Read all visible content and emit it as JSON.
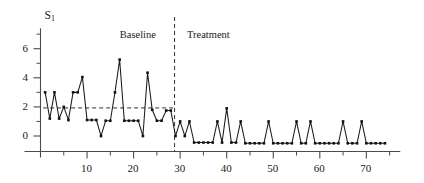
{
  "chart_data": {
    "type": "line",
    "title": "",
    "subtitle": "",
    "xlabel": "",
    "ylabel": "",
    "series_label": "S",
    "series_label_sub": "1",
    "xlim": [
      0,
      76
    ],
    "ylim": [
      -1.2,
      7.4
    ],
    "grid": false,
    "legend_position": "none",
    "xticks_major": [
      10,
      20,
      30,
      40,
      50,
      60,
      70
    ],
    "xticks_minor": [
      5,
      15,
      25,
      35,
      45,
      55,
      65,
      75
    ],
    "yticks_major": [
      0,
      2,
      4,
      6
    ],
    "yticks_minor": [
      1,
      3,
      5,
      7
    ],
    "annotations": [
      {
        "name": "baseline-label",
        "text": "Baseline",
        "x": 21.5,
        "y": 7.0
      },
      {
        "name": "treatment-label",
        "text": "Treatment",
        "x": 36.5,
        "y": 7.0
      }
    ],
    "phase_divider": {
      "name": "phase-divider",
      "x": 28.8,
      "style": "dashed"
    },
    "mean_line": {
      "name": "baseline-mean-line",
      "y": 1.93,
      "x_start": 1,
      "x_end": 28.8,
      "style": "dashed"
    },
    "series": [
      {
        "name": "S1",
        "marker": "square",
        "x": [
          1,
          2,
          3,
          4,
          5,
          6,
          7,
          8,
          9,
          10,
          11,
          12,
          13,
          14,
          15,
          16,
          17,
          18,
          19,
          20,
          21,
          22,
          23,
          24,
          25,
          26,
          27,
          28,
          29,
          30,
          31,
          32,
          33,
          34,
          35,
          36,
          37,
          38,
          39,
          40,
          41,
          42,
          43,
          44,
          45,
          46,
          47,
          48,
          49,
          50,
          51,
          52,
          53,
          54,
          55,
          56,
          57,
          58,
          59,
          60,
          61,
          62,
          63,
          64,
          65,
          66,
          67,
          68,
          69,
          70,
          71,
          72,
          73,
          74
        ],
        "values": [
          3.0,
          1.2,
          3.0,
          1.2,
          2.0,
          1.1,
          3.0,
          3.0,
          4.05,
          1.1,
          1.1,
          1.1,
          0.0,
          1.05,
          1.05,
          3.0,
          5.25,
          1.05,
          1.05,
          1.05,
          1.05,
          0.0,
          4.35,
          1.8,
          1.05,
          1.05,
          1.75,
          1.75,
          0.0,
          1.0,
          0.0,
          1.0,
          -0.45,
          -0.45,
          -0.45,
          -0.45,
          -0.45,
          1.0,
          -0.45,
          1.9,
          -0.45,
          -0.45,
          1.0,
          -0.5,
          -0.5,
          -0.5,
          -0.5,
          -0.5,
          1.0,
          -0.5,
          -0.5,
          -0.5,
          -0.5,
          -0.5,
          1.0,
          -0.5,
          -0.5,
          1.0,
          -0.5,
          -0.5,
          -0.5,
          -0.5,
          -0.5,
          -0.5,
          1.0,
          -0.5,
          -0.5,
          -0.5,
          1.0,
          -0.5,
          -0.5,
          -0.5,
          -0.5,
          -0.5
        ]
      }
    ]
  },
  "axis": {
    "x_tick_labels": [
      "10",
      "20",
      "30",
      "40",
      "50",
      "60",
      "70"
    ],
    "y_tick_labels": [
      "0",
      "2",
      "4",
      "6"
    ]
  },
  "colors": {
    "line": "#1a1a1a",
    "marker": "#111111",
    "axis": "#4b4b4b",
    "dashed": "#333333",
    "background": "#ffffff"
  }
}
